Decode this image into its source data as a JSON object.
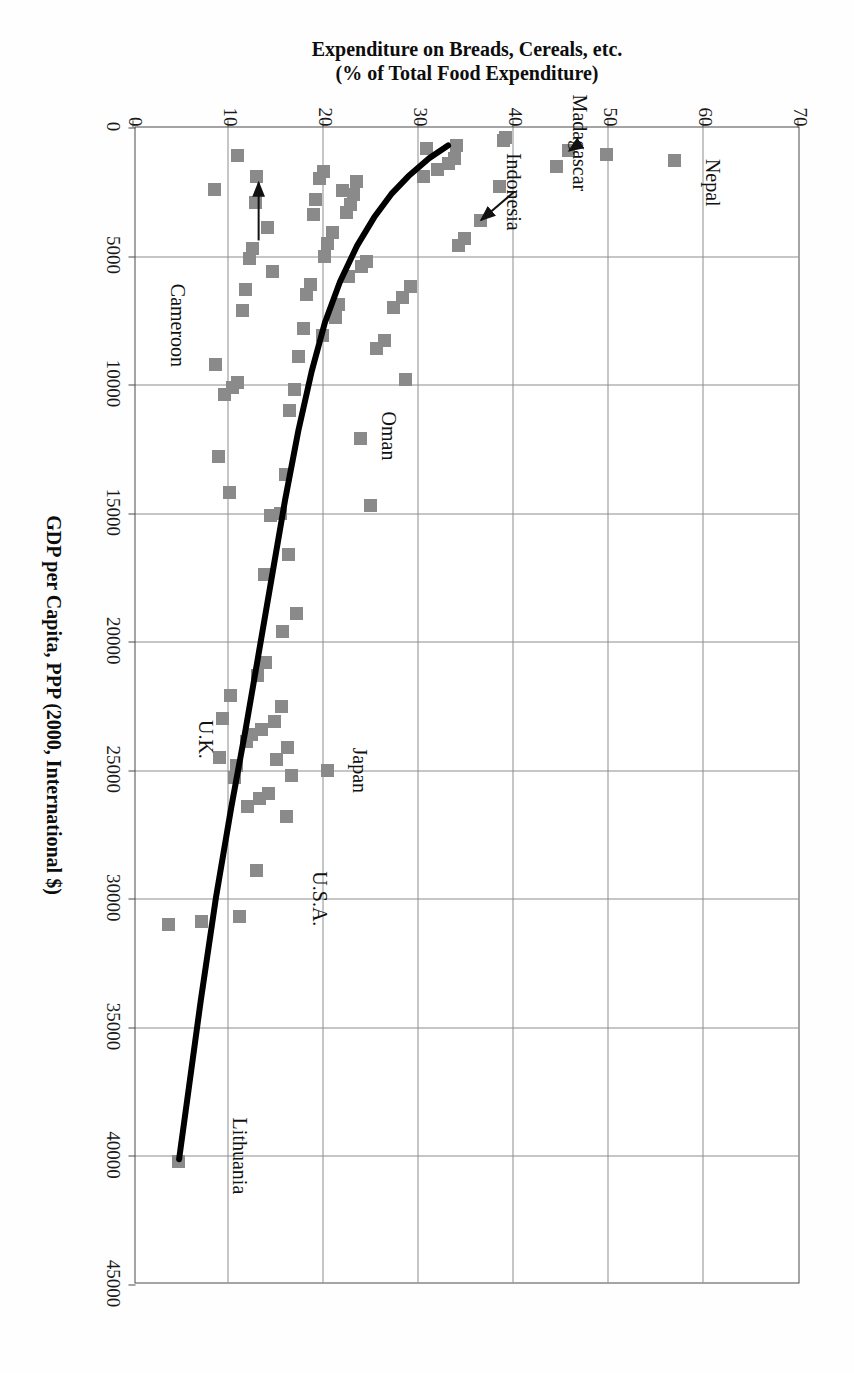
{
  "chart_data": {
    "type": "scatter",
    "title": "",
    "xlabel": "GDP per Capita, PPP (2000, International $)",
    "ylabel_line1": "Expenditure on Breads, Cereals, etc.",
    "ylabel_line2": "(% of Total Food Expenditure)",
    "xlim": [
      0,
      45000
    ],
    "ylim": [
      0,
      70
    ],
    "xticks": [
      0,
      5000,
      10000,
      15000,
      20000,
      25000,
      30000,
      35000,
      40000,
      45000
    ],
    "xticklabels": [
      "0",
      "5000",
      "10000",
      "15000",
      "20000",
      "25000",
      "30000",
      "35000",
      "40000",
      "45000"
    ],
    "yticks": [
      0,
      10,
      20,
      30,
      40,
      50,
      60,
      70
    ],
    "yticklabels": [
      "0",
      "10",
      "20",
      "30",
      "40",
      "50",
      "60",
      "70"
    ],
    "grid": true,
    "legend": "none",
    "marker_color": "#8a8a8a",
    "marker_shape": "square",
    "curve_color": "#000000",
    "frame_color": "#4a4a4a",
    "grid_color": "#8e8e8e",
    "points": [
      [
        1300,
        57.0
      ],
      [
        1050,
        49.8
      ],
      [
        900,
        45.8
      ],
      [
        1500,
        44.5
      ],
      [
        400,
        39.2
      ],
      [
        520,
        39.0
      ],
      [
        2300,
        38.5
      ],
      [
        3600,
        36.5
      ],
      [
        4300,
        34.8
      ],
      [
        4600,
        34.2
      ],
      [
        700,
        34.0
      ],
      [
        1200,
        33.8
      ],
      [
        1400,
        33.2
      ],
      [
        1650,
        32.0
      ],
      [
        800,
        30.8
      ],
      [
        1900,
        30.5
      ],
      [
        6200,
        29.2
      ],
      [
        6600,
        28.3
      ],
      [
        7000,
        27.4
      ],
      [
        9800,
        28.6
      ],
      [
        8300,
        26.4
      ],
      [
        8600,
        25.6
      ],
      [
        14700,
        25.0
      ],
      [
        5200,
        24.5
      ],
      [
        5400,
        24.0
      ],
      [
        12100,
        23.9
      ],
      [
        2100,
        23.5
      ],
      [
        2600,
        23.2
      ],
      [
        3000,
        22.8
      ],
      [
        3300,
        22.4
      ],
      [
        2450,
        22.0
      ],
      [
        5800,
        22.6
      ],
      [
        6900,
        21.6
      ],
      [
        7400,
        21.3
      ],
      [
        4100,
        20.9
      ],
      [
        4500,
        20.4
      ],
      [
        5000,
        20.1
      ],
      [
        1700,
        20.0
      ],
      [
        2000,
        19.6
      ],
      [
        2800,
        19.2
      ],
      [
        3400,
        18.9
      ],
      [
        6100,
        18.6
      ],
      [
        6500,
        18.2
      ],
      [
        7800,
        17.9
      ],
      [
        8900,
        17.4
      ],
      [
        10200,
        16.9
      ],
      [
        11000,
        16.4
      ],
      [
        13500,
        16.0
      ],
      [
        15000,
        15.5
      ],
      [
        15100,
        14.4
      ],
      [
        1900,
        13.0
      ],
      [
        2900,
        12.8
      ],
      [
        4700,
        12.5
      ],
      [
        5100,
        12.2
      ],
      [
        6300,
        11.8
      ],
      [
        7100,
        11.5
      ],
      [
        9900,
        11.0
      ],
      [
        10100,
        10.4
      ],
      [
        10400,
        9.6
      ],
      [
        19600,
        15.7
      ],
      [
        20800,
        13.9
      ],
      [
        21300,
        13.1
      ],
      [
        22500,
        15.6
      ],
      [
        23100,
        14.8
      ],
      [
        23400,
        13.5
      ],
      [
        23600,
        12.4
      ],
      [
        23900,
        11.9
      ],
      [
        24100,
        16.2
      ],
      [
        24600,
        15.1
      ],
      [
        24800,
        10.8
      ],
      [
        25200,
        16.6
      ],
      [
        25300,
        10.6
      ],
      [
        25900,
        14.2
      ],
      [
        26100,
        13.3
      ],
      [
        26400,
        12.0
      ],
      [
        26800,
        16.1
      ],
      [
        23000,
        9.4
      ],
      [
        24500,
        9.1
      ],
      [
        22100,
        10.2
      ],
      [
        28900,
        13.0
      ],
      [
        30700,
        11.2
      ],
      [
        30900,
        7.2
      ],
      [
        31000,
        3.7
      ],
      [
        40200,
        4.7
      ],
      [
        25000,
        20.4
      ],
      [
        18900,
        17.2
      ],
      [
        16600,
        16.3
      ],
      [
        17400,
        13.8
      ],
      [
        14200,
        10.1
      ],
      [
        12800,
        9.0
      ],
      [
        9200,
        8.6
      ],
      [
        2400,
        8.5
      ],
      [
        1100,
        10.9
      ],
      [
        8100,
        19.9
      ],
      [
        3900,
        14.1
      ],
      [
        5600,
        14.6
      ]
    ],
    "trend_curve": {
      "label": "fitted exponential trend",
      "points": [
        [
          700,
          33.0
        ],
        [
          1200,
          31.0
        ],
        [
          1900,
          28.8
        ],
        [
          2600,
          27.0
        ],
        [
          3500,
          25.2
        ],
        [
          4600,
          23.4
        ],
        [
          6000,
          21.6
        ],
        [
          7600,
          20.0
        ],
        [
          9500,
          18.6
        ],
        [
          11800,
          17.2
        ],
        [
          14500,
          15.8
        ],
        [
          17500,
          14.4
        ],
        [
          20500,
          13.0
        ],
        [
          23500,
          11.6
        ],
        [
          26500,
          10.1
        ],
        [
          30000,
          8.5
        ],
        [
          34000,
          6.9
        ],
        [
          37500,
          5.6
        ],
        [
          40200,
          4.6
        ]
      ]
    },
    "annotations": [
      {
        "name": "Nepal",
        "label_x": 2150,
        "label_y": 61.0,
        "arrow": false
      },
      {
        "name": "Madagascar",
        "label_x": 600,
        "label_y": 47.0,
        "arrow": true,
        "from_x": 600,
        "from_y": 47.0,
        "to_x": 900,
        "to_y": 45.8
      },
      {
        "name": "Indonesia",
        "label_x": 2500,
        "label_y": 40.0,
        "arrow": true,
        "from_x": 2500,
        "from_y": 40.0,
        "to_x": 3600,
        "to_y": 36.5
      },
      {
        "name": "Oman",
        "label_x": 12000,
        "label_y": 26.8,
        "arrow": false
      },
      {
        "name": "Cameroon",
        "label_x": 7700,
        "label_y": 4.6,
        "arrow": true,
        "from_x": 4400,
        "from_y": 13.0,
        "to_x": 2150,
        "to_y": 13.0
      },
      {
        "name": "Japan",
        "label_x": 25000,
        "label_y": 23.8,
        "arrow": false
      },
      {
        "name": "U.S.A.",
        "label_x": 30000,
        "label_y": 19.6,
        "arrow": false
      },
      {
        "name": "U.K.",
        "label_x": 23800,
        "label_y": 7.6,
        "arrow": false
      },
      {
        "name": "Lithuania",
        "label_x": 40000,
        "label_y": 11.2,
        "arrow": false
      }
    ]
  }
}
